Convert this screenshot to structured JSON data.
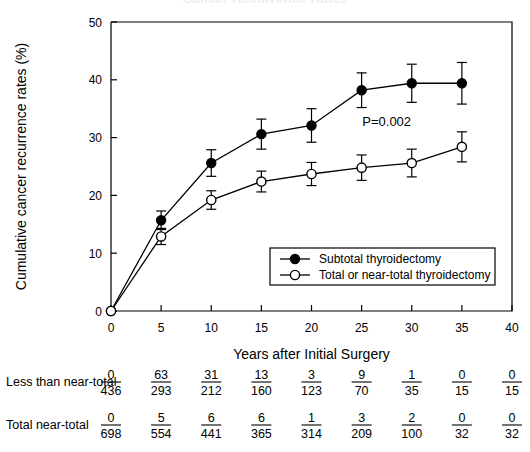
{
  "figure": {
    "clipped_title": "Cancer Recurrence Rates"
  },
  "chart_data": {
    "type": "line",
    "title": "Cancer Recurrence Rates",
    "xlabel": "Years after Initial Surgery",
    "ylabel": "Cumulative cancer recurrence rates (%)",
    "xlim": [
      0,
      40
    ],
    "ylim": [
      0,
      50
    ],
    "xticks": [
      0,
      5,
      10,
      15,
      20,
      25,
      30,
      35,
      40
    ],
    "yticks": [
      0,
      10,
      20,
      30,
      40,
      50
    ],
    "grid": false,
    "legend_position": "center-right-inside",
    "annotations": [
      {
        "text": "P=0.002",
        "x": 27.5,
        "y": 32.0
      }
    ],
    "x": [
      0,
      5,
      10,
      15,
      20,
      25,
      30,
      35
    ],
    "series": [
      {
        "name": "Subtotal thyroidectomy",
        "marker": "filled-circle",
        "values": [
          0,
          15.7,
          25.6,
          30.6,
          32.1,
          38.2,
          39.4,
          39.4
        ],
        "err_low": [
          0,
          1.6,
          2.3,
          2.6,
          2.9,
          3.0,
          3.3,
          3.6
        ],
        "err_high": [
          0,
          1.6,
          2.3,
          2.6,
          2.9,
          3.0,
          3.3,
          3.6
        ]
      },
      {
        "name": "Total or near-total thyroidectomy",
        "marker": "open-circle",
        "values": [
          0,
          12.9,
          19.2,
          22.4,
          23.7,
          24.8,
          25.6,
          28.4
        ],
        "err_low": [
          0,
          1.4,
          1.6,
          1.8,
          2.0,
          2.2,
          2.4,
          2.6
        ],
        "err_high": [
          0,
          1.4,
          1.6,
          1.8,
          2.0,
          2.2,
          2.4,
          2.6
        ]
      }
    ]
  },
  "legend": {
    "items": [
      {
        "label": "Subtotal thyroidectomy",
        "marker": "filled-circle"
      },
      {
        "label": "Total or near-total thyroidectomy",
        "marker": "open-circle"
      }
    ]
  },
  "risk_table": {
    "rows": [
      {
        "label": "Less than near-total",
        "numerators": [
          "0",
          "63",
          "31",
          "13",
          "3",
          "9",
          "1",
          "0",
          "0"
        ],
        "denominators": [
          "436",
          "293",
          "212",
          "160",
          "123",
          "70",
          "35",
          "15",
          "15"
        ]
      },
      {
        "label": "Total near-total",
        "numerators": [
          "0",
          "5",
          "6",
          "6",
          "1",
          "3",
          "2",
          "0",
          "0"
        ],
        "denominators": [
          "698",
          "554",
          "441",
          "365",
          "314",
          "209",
          "100",
          "32",
          "32"
        ]
      }
    ]
  },
  "colors": {
    "ink": "#000000",
    "background": "#ffffff",
    "clipped_title": "#eeeeee"
  }
}
